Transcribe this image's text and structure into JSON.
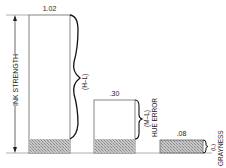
{
  "diagram": {
    "axis_label": "INK STRENGTH",
    "bars": [
      {
        "value_label": "1.02",
        "bracket_label": "(H–L)",
        "category_label": ""
      },
      {
        "value_label": ".30",
        "bracket_label": "(M–L)",
        "category_label": "HUE ERROR"
      },
      {
        "value_label": ".08",
        "bracket_label": "(L)",
        "category_label": "GRAYNESS"
      }
    ]
  },
  "colors": {
    "line": "#555555",
    "hatch": "#9a9a9a",
    "background": "#ffffff"
  }
}
